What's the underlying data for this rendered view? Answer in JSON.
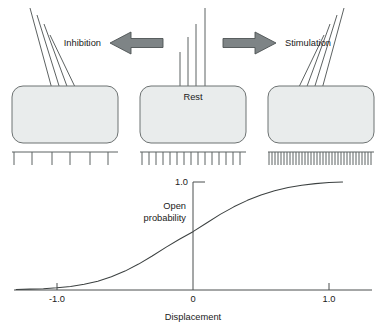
{
  "figure": {
    "background_color": "#ffffff"
  },
  "panels": [
    {
      "id": "inhibition",
      "state_label": "Inhibition",
      "cell_label": "",
      "bundle_direction": "left",
      "cilia_count": 4,
      "spike_count": 6,
      "spike_density": "sparse"
    },
    {
      "id": "rest",
      "state_label": "Rest",
      "cell_label": "Rest",
      "bundle_direction": "upright",
      "cilia_count": 4,
      "spike_count": 16,
      "spike_density": "medium"
    },
    {
      "id": "stimulation",
      "state_label": "Stimulation",
      "cell_label": "",
      "bundle_direction": "right",
      "cilia_count": 4,
      "spike_count": 35,
      "spike_density": "dense"
    }
  ],
  "arrows": [
    {
      "id": "arrow-left",
      "direction": "left",
      "label": "Inhibition",
      "color": "#7e8486"
    },
    {
      "id": "arrow-right",
      "direction": "right",
      "label": "Stimulation",
      "color": "#7e8486"
    }
  ],
  "colors": {
    "cell_fill": "#e9ecec",
    "cell_stroke": "#6d7272",
    "arrow_fill": "#7e8486",
    "line": "#5d6262",
    "text": "#1a1a1a"
  },
  "chart_data": {
    "type": "line",
    "title": "",
    "xlabel": "Displacement",
    "ylabel": "Open probability",
    "xlim": [
      -1.45,
      1.45
    ],
    "ylim": [
      0,
      1.12
    ],
    "grid": false,
    "legend": null,
    "xticks": [
      -1.0,
      0,
      1.0
    ],
    "xticklabels": [
      "-1.0",
      "0",
      "1.0"
    ],
    "yticks": [
      1.0
    ],
    "yticklabels": [
      "1.0"
    ],
    "series": [
      {
        "name": "Open probability",
        "x": [
          -1.3,
          -1.2,
          -1.1,
          -1.0,
          -0.9,
          -0.8,
          -0.7,
          -0.6,
          -0.5,
          -0.4,
          -0.3,
          -0.2,
          -0.1,
          0.0,
          0.1,
          0.2,
          0.3,
          0.4,
          0.5,
          0.6,
          0.7,
          0.8,
          0.9,
          1.0,
          1.1
        ],
        "y": [
          0.005,
          0.008,
          0.012,
          0.02,
          0.033,
          0.053,
          0.082,
          0.122,
          0.175,
          0.24,
          0.315,
          0.395,
          0.47,
          0.54,
          0.62,
          0.7,
          0.77,
          0.83,
          0.88,
          0.92,
          0.95,
          0.97,
          0.985,
          0.995,
          1.0
        ]
      }
    ]
  },
  "axis_labels": {
    "y_max": "1.0",
    "y_title_line1": "Open",
    "y_title_line2": "probability",
    "x_min": "-1.0",
    "x_zero": "0",
    "x_max": "1.0",
    "x_title": "Displacement"
  }
}
